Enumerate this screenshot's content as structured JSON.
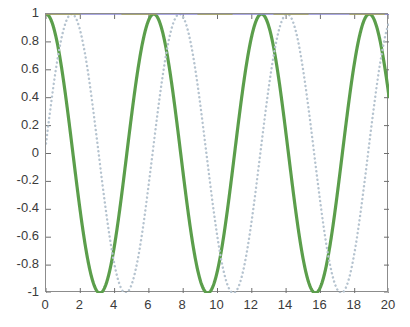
{
  "chart_data": {
    "type": "line",
    "title": "",
    "subtitle": "",
    "xlabel": "",
    "ylabel": "",
    "xlim": [
      0,
      20
    ],
    "ylim": [
      -1,
      1
    ],
    "grid": false,
    "legend": "none",
    "x_ticks": [
      0,
      2,
      4,
      6,
      8,
      10,
      12,
      14,
      16,
      18,
      20
    ],
    "x_tick_labels": [
      "0",
      "2",
      "4",
      "6",
      "8",
      "10",
      "12",
      "14",
      "16",
      "18",
      "20"
    ],
    "y_ticks": [
      -1,
      -0.8,
      -0.6,
      -0.4,
      -0.2,
      0,
      0.2,
      0.4,
      0.6,
      0.8,
      1
    ],
    "y_tick_labels": [
      "-1",
      "-0.8",
      "-0.6",
      "-0.4",
      "-0.2",
      "0",
      "0.2",
      "0.4",
      "0.6",
      "0.8",
      "1"
    ],
    "series": [
      {
        "name": "cosine",
        "style": "solid",
        "color": "#5b9e4b",
        "width": 3.2,
        "formula": "cos(x)",
        "amplitude": 1,
        "frequency": 1,
        "phase": 0,
        "x": [
          0,
          0.5,
          1,
          1.5,
          2,
          2.5,
          3,
          3.1416,
          3.5,
          4,
          4.5,
          5,
          5.5,
          6,
          6.2832,
          6.5,
          7,
          7.5,
          8,
          8.5,
          9,
          9.4248,
          9.5,
          10,
          10.5,
          11,
          11.5,
          12,
          12.5664,
          13,
          13.5,
          14,
          14.5,
          15,
          15.5,
          15.708,
          16,
          16.5,
          17,
          17.5,
          18,
          18.8496,
          19,
          19.5,
          20
        ],
        "y": [
          1,
          0.878,
          0.54,
          0.071,
          -0.416,
          -0.801,
          -0.99,
          -1,
          -0.936,
          -0.654,
          -0.211,
          0.284,
          0.709,
          0.96,
          1,
          0.977,
          0.754,
          0.347,
          -0.146,
          -0.602,
          -0.911,
          -1,
          -0.997,
          -0.839,
          -0.483,
          -0.004,
          0.484,
          0.844,
          1,
          0.907,
          0.575,
          0.137,
          -0.349,
          -0.76,
          -0.978,
          -1,
          -0.958,
          -0.699,
          -0.275,
          0.22,
          0.661,
          1,
          0.988,
          0.775,
          0.408
        ]
      },
      {
        "name": "cosine-shifted",
        "style": "dotted",
        "color": "#b5c3cf",
        "width": 2.4,
        "formula": "cos(x - 1.5)",
        "amplitude": 1,
        "frequency": 1,
        "phase": -1.5,
        "x": [
          0,
          0.5,
          1,
          1.5,
          2,
          2.5,
          3,
          3.5,
          4,
          4.5,
          4.6416,
          5,
          5.5,
          6,
          6.5,
          7,
          7.5,
          7.7832,
          8,
          8.5,
          9,
          9.5,
          10,
          10.5,
          10.9248,
          11,
          11.5,
          12,
          12.5,
          13,
          13.5,
          14,
          14.0664,
          14.5,
          15,
          15.5,
          16,
          16.5,
          17,
          17.208,
          17.5,
          18,
          18.5,
          19,
          19.5,
          20
        ],
        "y": [
          0.071,
          0.54,
          0.878,
          1,
          0.878,
          0.54,
          0.071,
          -0.416,
          -0.801,
          -0.99,
          -1,
          -0.936,
          -0.654,
          -0.211,
          0.284,
          0.709,
          0.96,
          1,
          0.977,
          0.754,
          0.347,
          -0.146,
          -0.602,
          -0.911,
          -1,
          -0.997,
          -0.839,
          -0.483,
          -0.004,
          0.484,
          0.844,
          0.997,
          1,
          0.907,
          0.575,
          0.137,
          -0.349,
          -0.76,
          -0.978,
          -1,
          -0.958,
          -0.699,
          -0.275,
          0.22,
          0.661,
          0.938
        ]
      },
      {
        "name": "upper-bound-line",
        "style": "solid",
        "color": "#8d8ad6",
        "width": 1.6,
        "formula": "y = 1",
        "constant": 1,
        "x": [
          0,
          20
        ],
        "y": [
          1,
          1
        ]
      },
      {
        "name": "upper-bound-overlay",
        "style": "solid",
        "color": "#a9a838",
        "width": 1.6,
        "formula": "y = 1",
        "constant": 1,
        "x": [
          0,
          20
        ],
        "y": [
          1,
          1
        ]
      }
    ]
  },
  "axes": {
    "frame_color": "#8c8c8c",
    "tick_color": "#6e6e6e",
    "label_color": "#3b3b3b",
    "background": "#ffffff"
  },
  "figure": {
    "background": "#ffffff",
    "width": 410,
    "height": 327
  }
}
